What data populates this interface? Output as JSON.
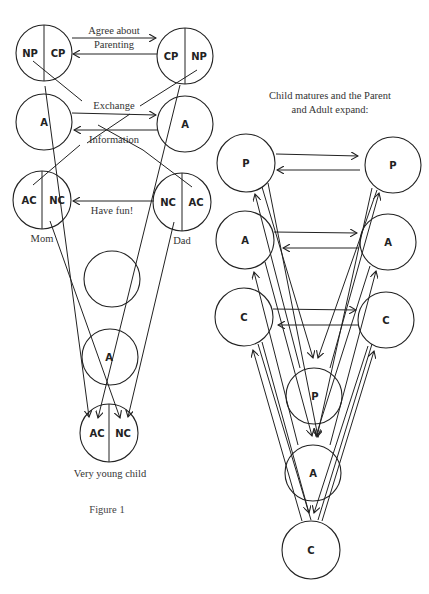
{
  "figure": {
    "caption": "Figure 1",
    "left_panel": {
      "parents": {
        "mom": {
          "label": "Mom",
          "states": {
            "parent_left": "NP",
            "parent_right": "CP",
            "adult": "A",
            "child_left": "AC",
            "child_right": "NC"
          }
        },
        "dad": {
          "label": "Dad",
          "states": {
            "parent_left": "CP",
            "parent_right": "NP",
            "adult": "A",
            "child_left": "NC",
            "child_right": "AC"
          }
        }
      },
      "transactions": {
        "parent_line1": "Agree about",
        "parent_line2": "Parenting",
        "adult_line1": "Exchange",
        "adult_line2": "Information",
        "child": "Have fun!"
      },
      "child": {
        "label": "Very young child",
        "adult": "A",
        "child_left": "AC",
        "child_right": "NC"
      }
    },
    "right_panel": {
      "title_line1": "Child matures and the Parent",
      "title_line2": "and Adult expand:",
      "left": {
        "p": "P",
        "a": "A",
        "c": "C"
      },
      "right": {
        "p": "P",
        "a": "A",
        "c": "C"
      },
      "child": {
        "p": "P",
        "a": "A",
        "c": "C"
      }
    }
  }
}
